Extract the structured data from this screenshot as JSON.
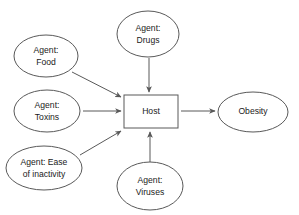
{
  "diagram": {
    "type": "causal-agent-host-outcome-diagram",
    "background_color": "#ffffff",
    "stroke_color": "#595959",
    "text_color": "#1a1a1a",
    "nodes": [
      {
        "id": "agent-food",
        "shape": "ellipse",
        "lines": [
          "Agent:",
          "Food"
        ],
        "line1": "Agent:",
        "line2": "Food",
        "cx": 46,
        "cy": 56,
        "rx": 32,
        "ry": 21
      },
      {
        "id": "agent-drugs",
        "shape": "ellipse",
        "lines": [
          "Agent:",
          "Drugs"
        ],
        "line1": "Agent:",
        "line2": "Drugs",
        "cx": 148,
        "cy": 34,
        "rx": 31,
        "ry": 23
      },
      {
        "id": "agent-toxins",
        "shape": "ellipse",
        "lines": [
          "Agent:",
          "Toxins"
        ],
        "line1": "Agent:",
        "line2": "Toxins",
        "cx": 47,
        "cy": 111,
        "rx": 33,
        "ry": 21
      },
      {
        "id": "agent-ease-of-inactivity",
        "shape": "ellipse",
        "lines": [
          "Agent: Ease",
          "of inactivity"
        ],
        "line1": "Agent: Ease",
        "line2": "of inactivity",
        "cx": 44,
        "cy": 168,
        "rx": 38,
        "ry": 22
      },
      {
        "id": "agent-viruses",
        "shape": "ellipse",
        "lines": [
          "Agent:",
          "Viruses"
        ],
        "line1": "Agent:",
        "line2": "Viruses",
        "cx": 150,
        "cy": 186,
        "rx": 33,
        "ry": 24
      },
      {
        "id": "host",
        "shape": "rectangle",
        "lines": [
          "Host"
        ],
        "line1": "Host",
        "x": 124,
        "y": 95,
        "width": 54,
        "height": 33
      },
      {
        "id": "obesity",
        "shape": "ellipse",
        "lines": [
          "Obesity"
        ],
        "line1": "Obesity",
        "cx": 253,
        "cy": 112,
        "rx": 35,
        "ry": 20
      }
    ],
    "edges": [
      {
        "id": "food-to-host",
        "from": "agent-food",
        "to": "host",
        "direction": "diagonal-down-right"
      },
      {
        "id": "drugs-to-host",
        "from": "agent-drugs",
        "to": "host",
        "direction": "down"
      },
      {
        "id": "toxins-to-host",
        "from": "agent-toxins",
        "to": "host",
        "direction": "right"
      },
      {
        "id": "inactivity-to-host",
        "from": "agent-ease-of-inactivity",
        "to": "host",
        "direction": "diagonal-up-right"
      },
      {
        "id": "viruses-to-host",
        "from": "agent-viruses",
        "to": "host",
        "direction": "up"
      },
      {
        "id": "host-to-obesity",
        "from": "host",
        "to": "obesity",
        "direction": "right"
      }
    ]
  }
}
